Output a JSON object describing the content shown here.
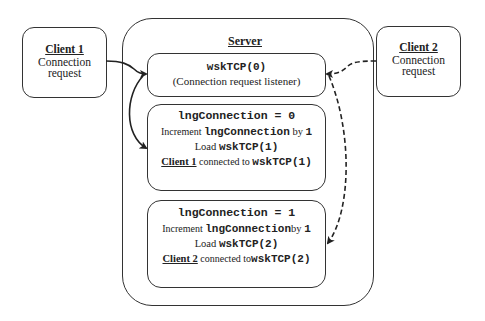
{
  "client1": {
    "title": "Client 1",
    "line1": "Connection",
    "line2": "request"
  },
  "client2": {
    "title": "Client 2",
    "line1": "Connection",
    "line2": "request"
  },
  "server": {
    "title": "Server",
    "listener": {
      "code": "wskTCP(0)",
      "caption": "(Connection request listener)"
    },
    "box1": {
      "header": "lngConnection = 0",
      "increment_prefix": "Increment ",
      "increment_var": "lngConnection",
      "increment_mid": " by ",
      "increment_val": "1",
      "load_prefix": "Load ",
      "load_code": "wskTCP(1)",
      "client": "Client 1",
      "connected_text": " connected to ",
      "connected_code": "wskTCP(1)"
    },
    "box2": {
      "header": "lngConnection = 1",
      "increment_prefix": "Increment ",
      "increment_var": "lngConnection",
      "increment_mid": "by ",
      "increment_val": "1",
      "load_prefix": "Load ",
      "load_code": "wskTCP(2)",
      "client": "Client 2",
      "connected_text": " connected to",
      "connected_code": "wskTCP(2)"
    }
  },
  "arrows": [
    {
      "from": "client1",
      "to": "listener",
      "style": "solid"
    },
    {
      "from": "listener",
      "to": "box1",
      "style": "solid"
    },
    {
      "from": "client2",
      "to": "listener",
      "style": "dashed"
    },
    {
      "from": "listener",
      "to": "box2",
      "style": "dashed"
    }
  ]
}
